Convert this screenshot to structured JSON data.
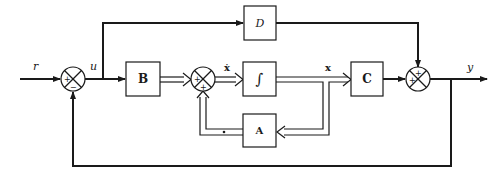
{
  "diagram": {
    "type": "state-space block diagram",
    "colors": {
      "line": "#1a1a1a",
      "background": "#ffffff"
    },
    "signals": {
      "input": "r",
      "control": "u",
      "state_derivative": "ẋ",
      "state": "x",
      "output": "y"
    },
    "blocks": {
      "B": "B",
      "integrator": "∫",
      "A": "A",
      "C": "C",
      "D": "D"
    },
    "junctions": {
      "sum1": {
        "signs": [
          "+",
          "−"
        ]
      },
      "sum2": {
        "signs": [
          "+",
          "+"
        ]
      },
      "sum3": {
        "signs": [
          "+",
          "+"
        ]
      }
    }
  }
}
